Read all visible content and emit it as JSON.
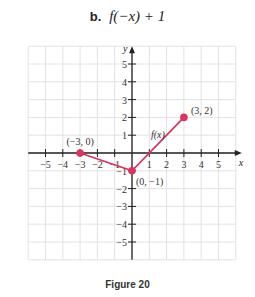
{
  "header": {
    "label": "b.",
    "expression": "f(−x) + 1"
  },
  "caption": "Figure 20",
  "colors": {
    "curve": "#d6365f",
    "grid": "#e2e2e2",
    "axis": "#222222"
  },
  "chart_data": {
    "type": "line",
    "title": "b. f(−x) + 1",
    "xlabel": "x",
    "ylabel": "y",
    "xlim": [
      -6,
      6
    ],
    "ylim": [
      -6,
      6
    ],
    "grid": true,
    "x_ticks": [
      -5,
      -4,
      -3,
      -2,
      -1,
      1,
      2,
      3,
      4,
      5
    ],
    "y_ticks": [
      -5,
      -4,
      -3,
      -2,
      -1,
      1,
      2,
      3,
      4,
      5
    ],
    "series": [
      {
        "name": "f(x)",
        "x": [
          -3,
          0,
          3
        ],
        "y": [
          0,
          -1,
          2
        ]
      }
    ],
    "annotations": [
      {
        "text": "(−3, 0)",
        "x": -3,
        "y": 0
      },
      {
        "text": "(0, −1)",
        "x": 0,
        "y": -1
      },
      {
        "text": "(3, 2)",
        "x": 3,
        "y": 2
      },
      {
        "text": "f(x)",
        "x": 1.7,
        "y": 1
      }
    ]
  }
}
